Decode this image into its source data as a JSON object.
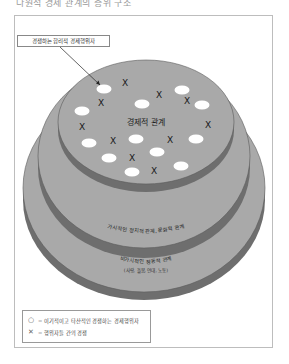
{
  "top_text": "다원적 경제 관계의 층위 구조",
  "callout": {
    "label": "경쟁하는 합리적 경제행위자"
  },
  "layers": {
    "inner": {
      "label": "경제적 관계"
    },
    "middle": {
      "label": "가시적인 정치적 관계, 문화적 관계"
    },
    "outer": {
      "label": "비가시적인 정동적 관계",
      "sublabel": "(사랑, 돌봄, 연대, 노동)"
    }
  },
  "legend": {
    "items": [
      {
        "symbol": "○",
        "text": "= 이기적이고 타산적인 경쟁하는 경제행위자"
      },
      {
        "symbol": "✕",
        "text": "= 행위자들 간의 경쟁"
      }
    ]
  },
  "colors": {
    "disc_top": "#a9a9a9",
    "disc_side": "#6e6e6e",
    "disc_outline": "#5a5a5a",
    "oval": "#ffffff",
    "mark": "#1a1a1a"
  },
  "ovals": [
    {
      "cx": 237,
      "cy": 76
    },
    {
      "cx": 104,
      "cy": 89
    },
    {
      "cx": 182,
      "cy": 90
    },
    {
      "cx": 142,
      "cy": 104
    },
    {
      "cx": 202,
      "cy": 105
    },
    {
      "cx": 82,
      "cy": 111
    },
    {
      "cx": 89,
      "cy": 143
    },
    {
      "cx": 136,
      "cy": 139
    },
    {
      "cx": 196,
      "cy": 139
    },
    {
      "cx": 109,
      "cy": 158
    },
    {
      "cx": 157,
      "cy": 152
    },
    {
      "cx": 181,
      "cy": 166
    },
    {
      "cx": 132,
      "cy": 172
    }
  ],
  "marks": [
    {
      "x": 125,
      "y": 83
    },
    {
      "x": 101,
      "y": 103
    },
    {
      "x": 159,
      "y": 95
    },
    {
      "x": 187,
      "y": 101
    },
    {
      "x": 82,
      "y": 127
    },
    {
      "x": 208,
      "y": 125
    },
    {
      "x": 113,
      "y": 141
    },
    {
      "x": 170,
      "y": 140
    },
    {
      "x": 132,
      "y": 158
    },
    {
      "x": 154,
      "y": 171
    }
  ]
}
